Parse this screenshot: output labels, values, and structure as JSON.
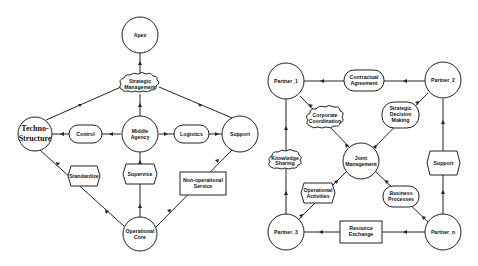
{
  "left_diagram": {
    "nodes": {
      "apex": [
        "Apex"
      ],
      "strategic_management": [
        "Strategic",
        "Management"
      ],
      "techno_structure": [
        "Techno-",
        "Structure"
      ],
      "control": [
        "Control"
      ],
      "middle_agency": [
        "Middle",
        "Agency"
      ],
      "logistics": [
        "Logistics"
      ],
      "support": [
        "Support"
      ],
      "standardize": [
        "Standardize"
      ],
      "supervise": [
        "Supervise"
      ],
      "non_operational_service": [
        "Non-operational",
        "Service"
      ],
      "operational_core": [
        "Operational",
        "Core"
      ]
    }
  },
  "right_diagram": {
    "nodes": {
      "partner_1": [
        "Partner_1"
      ],
      "contractual_agreement": [
        "Contractual",
        "Agreement"
      ],
      "partner_2": [
        "Partner_2"
      ],
      "corporate_coordination": [
        "Corporate",
        "Coordination"
      ],
      "strategic_decision_making": [
        "Strategic",
        "Decision",
        "Making"
      ],
      "joint_management": [
        "Joint",
        "Management"
      ],
      "knowledge_sharing": [
        "Knowledge",
        "Sharing"
      ],
      "support": [
        "Support"
      ],
      "operational_activities": [
        "Operational",
        "Activities"
      ],
      "business_processes": [
        "Business",
        "Processes"
      ],
      "partner_3": [
        "Partner_3"
      ],
      "resource_exchange": [
        "Resource",
        "Exchange"
      ],
      "partner_n": [
        "Partner_n"
      ]
    }
  }
}
